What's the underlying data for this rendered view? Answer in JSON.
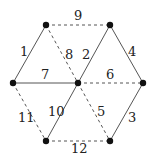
{
  "graph": {
    "nodes": [
      {
        "id": "TL",
        "x": 46,
        "y": 25
      },
      {
        "id": "TR",
        "x": 110,
        "y": 25
      },
      {
        "id": "L",
        "x": 13,
        "y": 83
      },
      {
        "id": "C",
        "x": 78,
        "y": 83
      },
      {
        "id": "R",
        "x": 143,
        "y": 83
      },
      {
        "id": "BL",
        "x": 46,
        "y": 141
      },
      {
        "id": "BR",
        "x": 110,
        "y": 141
      }
    ],
    "edges": [
      {
        "label": "1",
        "from": "TL",
        "to": "L",
        "style": "solid"
      },
      {
        "label": "2",
        "from": "C",
        "to": "TR",
        "style": "solid"
      },
      {
        "label": "3",
        "from": "R",
        "to": "BR",
        "style": "solid"
      },
      {
        "label": "4",
        "from": "TR",
        "to": "R",
        "style": "solid"
      },
      {
        "label": "5",
        "from": "C",
        "to": "BR",
        "style": "dashed"
      },
      {
        "label": "6",
        "from": "C",
        "to": "R",
        "style": "dashed"
      },
      {
        "label": "7",
        "from": "L",
        "to": "C",
        "style": "solid"
      },
      {
        "label": "8",
        "from": "TL",
        "to": "C",
        "style": "dashed"
      },
      {
        "label": "9",
        "from": "TL",
        "to": "TR",
        "style": "dashed"
      },
      {
        "label": "10",
        "from": "BL",
        "to": "C",
        "style": "solid"
      },
      {
        "label": "11",
        "from": "L",
        "to": "BL",
        "style": "dashed"
      },
      {
        "label": "12",
        "from": "BL",
        "to": "BR",
        "style": "dashed"
      }
    ]
  }
}
